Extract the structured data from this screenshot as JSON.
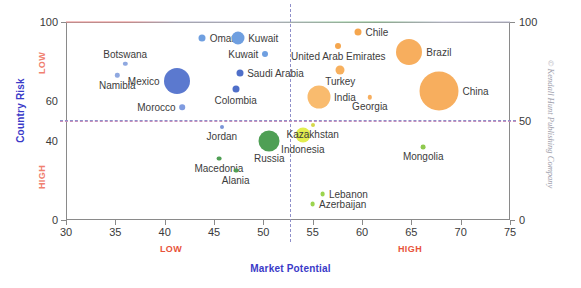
{
  "chart_data": {
    "type": "scatter",
    "title": "",
    "xlabel": "Market Potential",
    "ylabel": "Country Risk",
    "xlim": [
      30,
      75
    ],
    "ylim": [
      0,
      100
    ],
    "grid": false,
    "legend": "none",
    "x_ticks": [
      30,
      35,
      40,
      45,
      50,
      55,
      60,
      65,
      70,
      75
    ],
    "y_ticks_left": [
      0,
      40,
      60,
      100
    ],
    "y_ticks_right": [
      0,
      50,
      100
    ],
    "axis_qualifiers": {
      "x_low": "LOW",
      "x_high": "HIGH",
      "y_low": "LOW",
      "y_high": "HIGH"
    },
    "reference_lines": {
      "vertical_x": 52.5,
      "horizontal_y": 50
    },
    "bubble_size_note": "bubble area encodes market size",
    "points": [
      {
        "label": "Oman",
        "x": 43.8,
        "y": 92,
        "r": 3.5,
        "color": "#6f9fe0",
        "label_pos": "right"
      },
      {
        "label": "Kuwait",
        "x": 47.4,
        "y": 92,
        "r": 6.5,
        "color": "#6f9fe0",
        "label_pos": "right"
      },
      {
        "label": "Kuwait",
        "x": 50.2,
        "y": 84,
        "r": 3.0,
        "color": "#6f9fe0",
        "label_pos": "left"
      },
      {
        "label": "Botswana",
        "x": 36.0,
        "y": 79,
        "r": 2.2,
        "color": "#8fa8e0",
        "label_pos": "above"
      },
      {
        "label": "Namibia",
        "x": 35.2,
        "y": 73,
        "r": 2.2,
        "color": "#8fa8e0",
        "label_pos": "below"
      },
      {
        "label": "Mexico",
        "x": 41.2,
        "y": 70,
        "r": 13.0,
        "color": "#5b79cf",
        "label_pos": "left"
      },
      {
        "label": "Saudi Arabia",
        "x": 47.6,
        "y": 74,
        "r": 3.5,
        "color": "#4f6fc9",
        "label_pos": "right"
      },
      {
        "label": "Colombia",
        "x": 47.2,
        "y": 66,
        "r": 3.5,
        "color": "#4f6fc9",
        "label_pos": "below"
      },
      {
        "label": "Morocco",
        "x": 41.8,
        "y": 57,
        "r": 2.8,
        "color": "#7f9be0",
        "label_pos": "left"
      },
      {
        "label": "Jordan",
        "x": 45.8,
        "y": 47,
        "r": 2.0,
        "color": "#7a95d8",
        "label_pos": "below"
      },
      {
        "label": "Russia",
        "x": 50.6,
        "y": 40,
        "r": 10.5,
        "color": "#4f9f55",
        "label_pos": "below"
      },
      {
        "label": "Macedonia",
        "x": 45.5,
        "y": 31,
        "r": 2.4,
        "color": "#4f9f55",
        "label_pos": "below"
      },
      {
        "label": "Alania",
        "x": 47.2,
        "y": 25,
        "r": 2.4,
        "color": "#4f9f55",
        "label_pos": "below"
      },
      {
        "label": "Indonesia",
        "x": 54.0,
        "y": 43,
        "r": 7.5,
        "color": "#e2ee4e",
        "label_pos": "below"
      },
      {
        "label": "Kazakhstan",
        "x": 55.0,
        "y": 48,
        "r": 2.0,
        "color": "#d6d84a",
        "label_pos": "below"
      },
      {
        "label": "Lebanon",
        "x": 56.0,
        "y": 13,
        "r": 2.4,
        "color": "#9cd44e",
        "label_pos": "right"
      },
      {
        "label": "Azerbaijan",
        "x": 55.0,
        "y": 8,
        "r": 2.4,
        "color": "#9cd44e",
        "label_pos": "right"
      },
      {
        "label": "Mongolia",
        "x": 66.2,
        "y": 37,
        "r": 2.4,
        "color": "#8fc94e",
        "label_pos": "below"
      },
      {
        "label": "Chile",
        "x": 59.6,
        "y": 95,
        "r": 3.5,
        "color": "#f5a64e",
        "label_pos": "right"
      },
      {
        "label": "United Arab Emirates",
        "x": 57.6,
        "y": 88,
        "r": 3.0,
        "color": "#f5a64e",
        "label_pos": "below"
      },
      {
        "label": "Turkey",
        "x": 57.8,
        "y": 76,
        "r": 4.5,
        "color": "#f7b05e",
        "label_pos": "below"
      },
      {
        "label": "Brazil",
        "x": 64.8,
        "y": 85,
        "r": 13.0,
        "color": "#f7ae5e",
        "label_pos": "right"
      },
      {
        "label": "India",
        "x": 55.6,
        "y": 62,
        "r": 11.5,
        "color": "#f9bb6e",
        "label_pos": "right"
      },
      {
        "label": "Georgia",
        "x": 60.8,
        "y": 62,
        "r": 2.2,
        "color": "#f7ae5e",
        "label_pos": "below"
      },
      {
        "label": "China",
        "x": 67.8,
        "y": 65,
        "r": 19.5,
        "color": "#f7ae5e",
        "label_pos": "right"
      }
    ]
  },
  "credit": "© Kendall Hunt Publishing Company"
}
